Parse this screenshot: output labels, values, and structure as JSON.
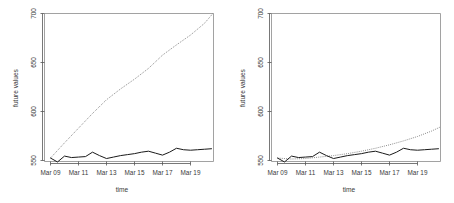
{
  "figure": {
    "background_color": "#ffffff",
    "panel_count": 2
  },
  "chart_data": [
    {
      "type": "line",
      "panel": "left",
      "title": "",
      "xlabel": "time",
      "ylabel": "future values",
      "ylim": [
        540,
        705
      ],
      "ytick_values": [
        550,
        600,
        650,
        700
      ],
      "ytick_labels": [
        "550",
        "600",
        "650",
        "700"
      ],
      "xtick_labels": [
        "Mar 09",
        "Mar 11",
        "Mar 13",
        "Mar 15",
        "Mar 17",
        "Mar 19"
      ],
      "xtick_positions": [
        9,
        11,
        13,
        15,
        17,
        19
      ],
      "xlim": [
        8.6,
        20.6
      ],
      "grid": false,
      "legend": "none",
      "series": [
        {
          "name": "observed",
          "style": "solid",
          "color": "#1a1a1a",
          "x": [
            9,
            9.5,
            10,
            10.5,
            11,
            11.5,
            12,
            12.5,
            13,
            13.5,
            14,
            14.5,
            15,
            15.5,
            16,
            16.5,
            17,
            17.5,
            18,
            18.5,
            19,
            19.5,
            20,
            20.5
          ],
          "values": [
            552.5,
            548.5,
            554.5,
            553.0,
            553.5,
            554.0,
            558.5,
            555.0,
            552.0,
            553.5,
            555.0,
            556.0,
            557.0,
            558.5,
            559.5,
            557.5,
            555.5,
            558.5,
            562.5,
            561.0,
            560.5,
            561.0,
            561.5,
            562.0
          ]
        },
        {
          "name": "forecast",
          "style": "dotted",
          "color": "#7d7d7d",
          "x": [
            9,
            10,
            11,
            12,
            13,
            14,
            15,
            16,
            17,
            18,
            19,
            20,
            20.6
          ],
          "values": [
            552.5,
            568.0,
            583.0,
            598.0,
            612.0,
            623.0,
            633.0,
            644.0,
            657.5,
            668.0,
            678.0,
            690.0,
            700.0
          ]
        }
      ]
    },
    {
      "type": "line",
      "panel": "right",
      "title": "",
      "xlabel": "time",
      "ylabel": "future values",
      "ylim": [
        540,
        705
      ],
      "ytick_values": [
        550,
        600,
        650,
        700
      ],
      "ytick_labels": [
        "550",
        "600",
        "650",
        "700"
      ],
      "xtick_labels": [
        "Mar 09",
        "Mar 11",
        "Mar 13",
        "Mar 15",
        "Mar 17",
        "Mar 19"
      ],
      "xtick_positions": [
        9,
        11,
        13,
        15,
        17,
        19
      ],
      "xlim": [
        8.6,
        20.6
      ],
      "grid": false,
      "legend": "none",
      "series": [
        {
          "name": "observed",
          "style": "solid",
          "color": "#1a1a1a",
          "x": [
            9,
            9.5,
            10,
            10.5,
            11,
            11.5,
            12,
            12.5,
            13,
            13.5,
            14,
            14.5,
            15,
            15.5,
            16,
            16.5,
            17,
            17.5,
            18,
            18.5,
            19,
            19.5,
            20,
            20.5
          ],
          "values": [
            552.5,
            548.5,
            554.5,
            553.0,
            553.5,
            554.0,
            558.5,
            555.0,
            552.0,
            553.5,
            555.0,
            556.0,
            557.0,
            558.5,
            559.5,
            557.5,
            555.5,
            558.5,
            562.5,
            561.0,
            560.5,
            561.0,
            561.5,
            562.0
          ]
        },
        {
          "name": "forecast",
          "style": "dotted",
          "color": "#7d7d7d",
          "x": [
            9,
            10,
            11,
            12,
            13,
            14,
            15,
            16,
            17,
            18,
            19,
            20,
            20.6
          ],
          "values": [
            552.5,
            551.5,
            552.0,
            553.5,
            555.0,
            557.0,
            559.5,
            562.5,
            566.0,
            570.0,
            574.5,
            580.0,
            584.0
          ]
        }
      ]
    }
  ]
}
